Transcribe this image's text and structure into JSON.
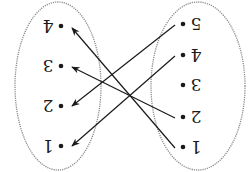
{
  "diagram": {
    "type": "mapping-arrow-diagram",
    "orientation": "rotated-180",
    "colors": {
      "ink": "#1a1a1a",
      "ellipse": "#8a8a8a",
      "background": "#ffffff"
    },
    "left_set": {
      "ellipse": {
        "cx": 58,
        "cy": 86,
        "rx": 43,
        "ry": 84
      },
      "elements": [
        {
          "label": "4",
          "x": 61,
          "y": 26
        },
        {
          "label": "3",
          "x": 61,
          "y": 66
        },
        {
          "label": "2",
          "x": 61,
          "y": 106
        },
        {
          "label": "1",
          "x": 61,
          "y": 146
        }
      ]
    },
    "right_set": {
      "ellipse": {
        "cx": 198,
        "cy": 86,
        "rx": 47,
        "ry": 84
      },
      "elements": [
        {
          "label": "5",
          "x": 183,
          "y": 24
        },
        {
          "label": "4",
          "x": 183,
          "y": 55
        },
        {
          "label": "3",
          "x": 183,
          "y": 85
        },
        {
          "label": "2",
          "x": 183,
          "y": 117
        },
        {
          "label": "1",
          "x": 183,
          "y": 147
        }
      ]
    },
    "arrows": [
      {
        "from": "5",
        "to": "2",
        "x1": 175,
        "y1": 25,
        "x2": 72,
        "y2": 106
      },
      {
        "from": "4",
        "to": "1",
        "x1": 175,
        "y1": 56,
        "x2": 72,
        "y2": 146
      },
      {
        "from": "2",
        "to": "3",
        "x1": 175,
        "y1": 118,
        "x2": 72,
        "y2": 67
      },
      {
        "from": "1",
        "to": "4",
        "x1": 175,
        "y1": 148,
        "x2": 72,
        "y2": 28
      }
    ]
  }
}
